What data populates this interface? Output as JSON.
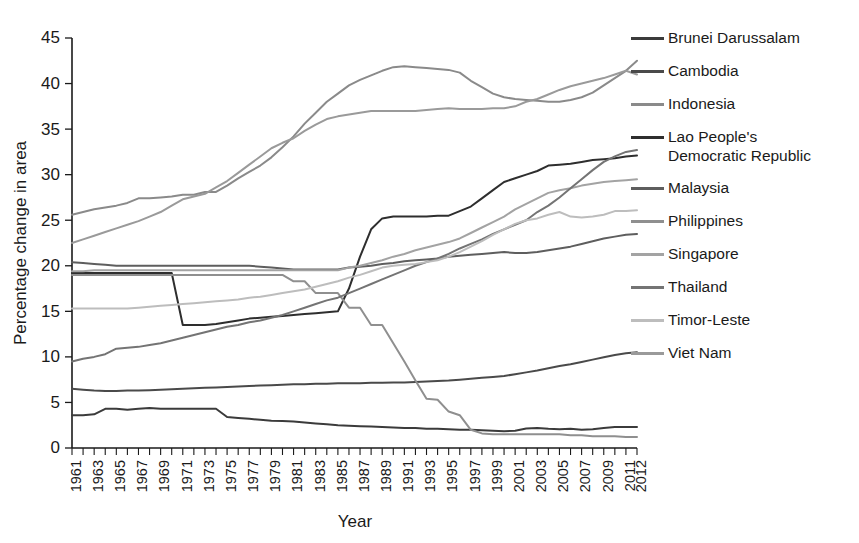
{
  "chart_data": {
    "type": "line",
    "title": "",
    "xlabel": "Year",
    "ylabel": "Percentage change in area",
    "xlim": [
      1961,
      2012
    ],
    "ylim": [
      0,
      45
    ],
    "yticks": [
      0,
      5,
      10,
      15,
      20,
      25,
      30,
      35,
      40,
      45
    ],
    "grid": false,
    "legend_position": "right",
    "x": [
      1961,
      1962,
      1963,
      1964,
      1965,
      1966,
      1967,
      1968,
      1969,
      1970,
      1971,
      1972,
      1973,
      1974,
      1975,
      1976,
      1977,
      1978,
      1979,
      1980,
      1981,
      1982,
      1983,
      1984,
      1985,
      1986,
      1987,
      1988,
      1989,
      1990,
      1991,
      1992,
      1993,
      1994,
      1995,
      1996,
      1997,
      1998,
      1999,
      2000,
      2001,
      2002,
      2003,
      2004,
      2005,
      2006,
      2007,
      2008,
      2009,
      2010,
      2011,
      2012
    ],
    "xticklabels": [
      "1961",
      "1963",
      "1965",
      "1967",
      "1969",
      "1971",
      "1973",
      "1975",
      "1977",
      "1979",
      "1981",
      "1983",
      "1985",
      "1987",
      "1989",
      "1991",
      "1993",
      "1995",
      "1997",
      "1999",
      "2001",
      "2003",
      "2005",
      "2007",
      "2009",
      "2011",
      "2012"
    ],
    "series": [
      {
        "name": "Brunei Darussalam",
        "color": "#3b3b3b",
        "values": [
          3.6,
          3.6,
          3.7,
          4.3,
          4.3,
          4.2,
          4.3,
          4.4,
          4.3,
          4.3,
          4.3,
          4.3,
          4.3,
          4.3,
          3.4,
          3.3,
          3.2,
          3.1,
          3.0,
          2.95,
          2.9,
          2.8,
          2.7,
          2.6,
          2.5,
          2.45,
          2.4,
          2.35,
          2.3,
          2.25,
          2.2,
          2.2,
          2.1,
          2.1,
          2.05,
          2.0,
          2.0,
          1.95,
          1.9,
          1.85,
          1.9,
          2.15,
          2.2,
          2.1,
          2.05,
          2.1,
          2.0,
          2.05,
          2.2,
          2.3,
          2.3,
          2.3
        ]
      },
      {
        "name": "Cambodia",
        "color": "#4a4a4a",
        "values": [
          6.5,
          6.4,
          6.3,
          6.25,
          6.25,
          6.3,
          6.3,
          6.35,
          6.4,
          6.45,
          6.5,
          6.55,
          6.6,
          6.65,
          6.7,
          6.75,
          6.8,
          6.85,
          6.9,
          6.95,
          7.0,
          7.0,
          7.05,
          7.05,
          7.1,
          7.1,
          7.1,
          7.15,
          7.15,
          7.2,
          7.2,
          7.25,
          7.3,
          7.35,
          7.4,
          7.5,
          7.6,
          7.7,
          7.8,
          7.9,
          8.1,
          8.3,
          8.5,
          8.75,
          9.0,
          9.2,
          9.45,
          9.7,
          9.95,
          10.2,
          10.4,
          10.5
        ]
      },
      {
        "name": "Indonesia",
        "color": "#8a8a8a",
        "values": [
          25.6,
          25.9,
          26.2,
          26.4,
          26.6,
          26.9,
          27.4,
          27.4,
          27.5,
          27.6,
          27.8,
          27.8,
          28.1,
          28.1,
          28.8,
          29.6,
          30.3,
          31.0,
          31.9,
          33.0,
          34.2,
          35.6,
          36.8,
          38.0,
          38.9,
          39.8,
          40.4,
          40.9,
          41.4,
          41.8,
          41.9,
          41.8,
          41.7,
          41.6,
          41.5,
          41.2,
          40.3,
          39.6,
          38.9,
          38.5,
          38.3,
          38.2,
          38.1,
          38.0,
          38.0,
          38.2,
          38.5,
          39.0,
          39.8,
          40.6,
          41.4,
          42.5
        ]
      },
      {
        "name": "Lao People's\nDemocratic Republic",
        "color": "#2e2e2e",
        "values": [
          19.2,
          19.2,
          19.2,
          19.2,
          19.2,
          19.2,
          19.2,
          19.2,
          19.2,
          19.2,
          13.5,
          13.5,
          13.5,
          13.6,
          13.8,
          14.0,
          14.2,
          14.3,
          14.4,
          14.5,
          14.6,
          14.7,
          14.8,
          14.9,
          15.0,
          17.5,
          21.0,
          24.0,
          25.2,
          25.4,
          25.4,
          25.4,
          25.4,
          25.5,
          25.5,
          26.0,
          26.5,
          27.4,
          28.3,
          29.2,
          29.6,
          30.0,
          30.4,
          31.0,
          31.1,
          31.2,
          31.4,
          31.6,
          31.7,
          31.8,
          32.0,
          32.1
        ]
      },
      {
        "name": "Malaysia",
        "color": "#5e5e5e",
        "values": [
          20.4,
          20.3,
          20.2,
          20.1,
          20.0,
          20.0,
          20.0,
          20.0,
          20.0,
          20.0,
          20.0,
          20.0,
          20.0,
          20.0,
          20.0,
          20.0,
          20.0,
          19.9,
          19.8,
          19.7,
          19.6,
          19.6,
          19.6,
          19.6,
          19.6,
          19.8,
          19.9,
          20.0,
          20.2,
          20.3,
          20.5,
          20.6,
          20.7,
          20.8,
          21.0,
          21.1,
          21.2,
          21.3,
          21.4,
          21.5,
          21.4,
          21.4,
          21.5,
          21.7,
          21.9,
          22.1,
          22.4,
          22.7,
          23.0,
          23.2,
          23.4,
          23.5
        ]
      },
      {
        "name": "Philippines",
        "color": "#8f8f8f",
        "values": [
          19.0,
          19.0,
          19.0,
          19.0,
          19.0,
          19.0,
          19.0,
          19.0,
          19.0,
          19.0,
          19.0,
          19.0,
          19.0,
          19.0,
          19.0,
          19.0,
          19.0,
          19.0,
          19.0,
          19.0,
          18.3,
          18.3,
          17.0,
          17.0,
          17.0,
          15.4,
          15.4,
          13.5,
          13.5,
          11.5,
          9.5,
          7.4,
          5.4,
          5.3,
          4.0,
          3.6,
          2.0,
          1.6,
          1.5,
          1.5,
          1.5,
          1.5,
          1.5,
          1.5,
          1.5,
          1.4,
          1.4,
          1.3,
          1.3,
          1.3,
          1.2,
          1.2
        ]
      },
      {
        "name": "Singapore",
        "color": "#a3a3a3",
        "values": [
          19.4,
          19.4,
          19.5,
          19.5,
          19.5,
          19.5,
          19.5,
          19.5,
          19.5,
          19.5,
          19.5,
          19.5,
          19.5,
          19.5,
          19.5,
          19.5,
          19.5,
          19.5,
          19.5,
          19.5,
          19.5,
          19.5,
          19.5,
          19.5,
          19.5,
          19.8,
          20.0,
          20.3,
          20.6,
          21.0,
          21.3,
          21.7,
          22.0,
          22.3,
          22.6,
          23.0,
          23.6,
          24.2,
          24.8,
          25.4,
          26.2,
          26.8,
          27.4,
          28.0,
          28.3,
          28.5,
          28.8,
          29.0,
          29.2,
          29.3,
          29.4,
          29.5
        ]
      },
      {
        "name": "Thailand",
        "color": "#747474",
        "values": [
          9.5,
          9.8,
          10.0,
          10.3,
          10.9,
          11.0,
          11.1,
          11.3,
          11.5,
          11.8,
          12.1,
          12.4,
          12.7,
          13.0,
          13.3,
          13.5,
          13.8,
          14.0,
          14.3,
          14.6,
          15.0,
          15.4,
          15.8,
          16.2,
          16.5,
          17.0,
          17.5,
          18.0,
          18.5,
          19.0,
          19.5,
          20.0,
          20.4,
          20.8,
          21.3,
          21.9,
          22.4,
          22.9,
          23.5,
          24.0,
          24.5,
          25.0,
          25.9,
          26.6,
          27.5,
          28.5,
          29.5,
          30.5,
          31.4,
          32.0,
          32.5,
          32.7
        ]
      },
      {
        "name": "Timor-Leste",
        "color": "#bdbdbd",
        "values": [
          15.3,
          15.3,
          15.3,
          15.3,
          15.3,
          15.3,
          15.4,
          15.5,
          15.6,
          15.7,
          15.8,
          15.9,
          16.0,
          16.1,
          16.2,
          16.3,
          16.5,
          16.6,
          16.8,
          17.0,
          17.2,
          17.4,
          17.7,
          18.0,
          18.3,
          18.7,
          19.0,
          19.4,
          19.8,
          20.0,
          20.1,
          20.2,
          20.4,
          20.6,
          21.0,
          21.5,
          22.1,
          22.7,
          23.4,
          24.0,
          24.6,
          25.0,
          25.2,
          25.6,
          25.9,
          25.4,
          25.3,
          25.4,
          25.6,
          26.0,
          26.0,
          26.1
        ]
      },
      {
        "name": "Viet Nam",
        "color": "#9a9a9a",
        "values": [
          22.5,
          22.9,
          23.3,
          23.7,
          24.1,
          24.5,
          24.9,
          25.4,
          25.9,
          26.6,
          27.3,
          27.6,
          27.9,
          28.6,
          29.3,
          30.2,
          31.1,
          32.0,
          32.9,
          33.5,
          34.0,
          34.8,
          35.5,
          36.1,
          36.4,
          36.6,
          36.8,
          37.0,
          37.0,
          37.0,
          37.0,
          37.0,
          37.1,
          37.2,
          37.3,
          37.2,
          37.2,
          37.2,
          37.3,
          37.3,
          37.5,
          38.0,
          38.3,
          38.8,
          39.3,
          39.7,
          40.0,
          40.3,
          40.6,
          41.0,
          41.4,
          41.0
        ]
      }
    ]
  },
  "legend": {
    "items": [
      {
        "label": "Brunei Darussalam",
        "color": "#3b3b3b"
      },
      {
        "label": "Cambodia",
        "color": "#4a4a4a"
      },
      {
        "label": "Indonesia",
        "color": "#8a8a8a"
      },
      {
        "label": "Lao People's\nDemocratic Republic",
        "color": "#2e2e2e"
      },
      {
        "label": "Malaysia",
        "color": "#5e5e5e"
      },
      {
        "label": "Philippines",
        "color": "#8f8f8f"
      },
      {
        "label": "Singapore",
        "color": "#a3a3a3"
      },
      {
        "label": "Thailand",
        "color": "#747474"
      },
      {
        "label": "Timor-Leste",
        "color": "#bdbdbd"
      },
      {
        "label": "Viet Nam",
        "color": "#9a9a9a"
      }
    ]
  }
}
